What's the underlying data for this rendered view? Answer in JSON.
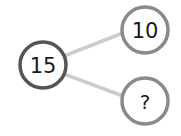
{
  "diagram": {
    "type": "number-bond",
    "whole": {
      "label": "15",
      "cx": 43,
      "cy": 65,
      "r": 23,
      "stroke": "#555555"
    },
    "parts": [
      {
        "label": "10",
        "cx": 145,
        "cy": 30,
        "r": 23,
        "stroke": "#8a8a8a"
      },
      {
        "label": "?",
        "cx": 145,
        "cy": 101,
        "r": 23,
        "stroke": "#8a8a8a"
      }
    ],
    "connector_color": "#cccccc"
  }
}
